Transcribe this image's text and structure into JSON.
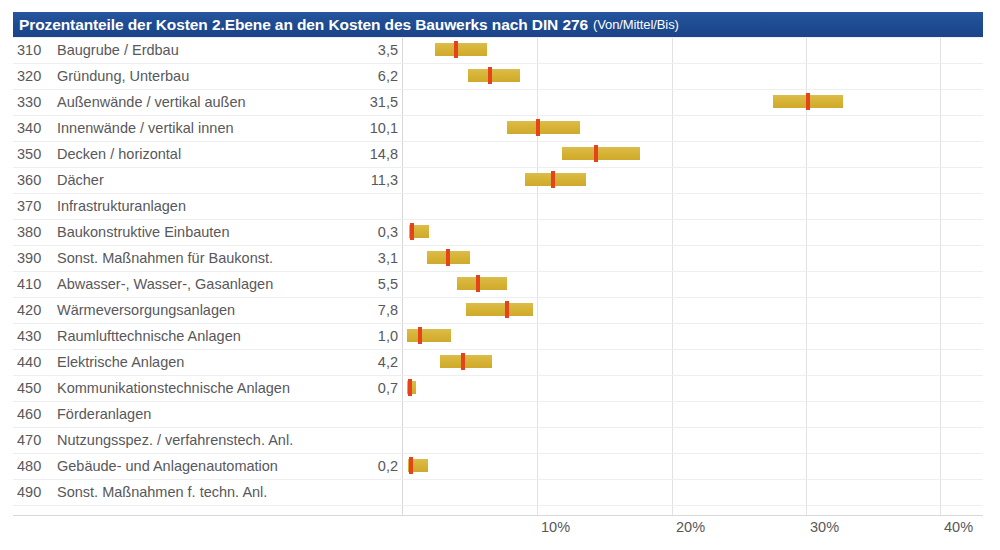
{
  "header": {
    "title": "Prozentanteile der Kosten 2.Ebene an den Kosten des Bauwerks nach DIN 276",
    "subtitle": "(Von/Mittel/Bis)"
  },
  "chart_data": {
    "type": "bar",
    "title": "Prozentanteile der Kosten 2.Ebene an den Kosten des Bauwerks nach DIN 276 (Von/Mittel/Bis)",
    "xlabel": "",
    "ylabel": "",
    "xlim": [
      0,
      43
    ],
    "grid": true,
    "legend": "none",
    "value_series_name": "Mittel",
    "range_series_name": "Von/Bis",
    "xticks": [
      "10%",
      "20%",
      "30%",
      "40%"
    ],
    "xtick_values": [
      10,
      20,
      30,
      40
    ],
    "categories": [
      "310 Baugrube / Erdbau",
      "320 Gründung, Unterbau",
      "330 Außenwände / vertikal außen",
      "340 Innenwände / vertikal innen",
      "350 Decken / horizontal",
      "360 Dächer",
      "370 Infrastrukturanlagen",
      "380 Baukonstruktive Einbauten",
      "390 Sonst. Maßnahmen für Baukonst.",
      "410 Abwasser-, Wasser-, Gasanlagen",
      "420 Wärmeversorgungsanlagen",
      "430 Raumlufttechnische Anlagen",
      "440 Elektrische Anlagen",
      "450 Kommunikationstechnische Anlagen",
      "460 Förderanlagen",
      "470 Nutzungsspez. / verfahrenstech. Anl.",
      "480 Gebäude- und Anlagenautomation",
      "490 Sonst. Maßnahmen f. techn. Anl."
    ],
    "values": [
      3.5,
      6.2,
      31.5,
      10.1,
      14.8,
      11.3,
      null,
      0.3,
      3.1,
      5.5,
      7.8,
      1.0,
      4.2,
      0.7,
      null,
      null,
      0.2,
      null
    ],
    "range_low": [
      2.4,
      4.8,
      27.5,
      7.8,
      11.8,
      9.2,
      null,
      0.5,
      1.9,
      4.1,
      4.8,
      0.4,
      2.8,
      0.4,
      null,
      null,
      0.4,
      null
    ],
    "range_high": [
      6.2,
      8.6,
      32.7,
      13.2,
      17.6,
      13.6,
      null,
      1.9,
      5.0,
      7.8,
      9.7,
      3.6,
      6.7,
      1.0,
      null,
      null,
      1.9,
      null
    ]
  },
  "rows": [
    {
      "code": "310",
      "label": "Baugrube / Erdbau",
      "value": "3,5",
      "bar": {
        "left": 435,
        "width": 52,
        "marker": 454
      }
    },
    {
      "code": "320",
      "label": "Gründung, Unterbau",
      "value": "6,2",
      "bar": {
        "left": 468,
        "width": 52,
        "marker": 488
      }
    },
    {
      "code": "330",
      "label": "Außenwände / vertikal außen",
      "value": "31,5",
      "bar": {
        "left": 773,
        "width": 70,
        "marker": 806
      }
    },
    {
      "code": "340",
      "label": "Innenwände / vertikal innen",
      "value": "10,1",
      "bar": {
        "left": 507,
        "width": 73,
        "marker": 536
      }
    },
    {
      "code": "350",
      "label": "Decken / horizontal",
      "value": "14,8",
      "bar": {
        "left": 562,
        "width": 78,
        "marker": 594
      }
    },
    {
      "code": "360",
      "label": "Dächer",
      "value": "11,3",
      "bar": {
        "left": 525,
        "width": 61,
        "marker": 551
      }
    },
    {
      "code": "370",
      "label": "Infrastrukturanlagen",
      "value": "",
      "bar": null
    },
    {
      "code": "380",
      "label": "Baukonstruktive Einbauten",
      "value": "0,3",
      "bar": {
        "left": 409,
        "width": 20,
        "marker": 410
      }
    },
    {
      "code": "390",
      "label": "Sonst. Maßnahmen für Baukonst.",
      "value": "3,1",
      "bar": {
        "left": 427,
        "width": 43,
        "marker": 446
      }
    },
    {
      "code": "410",
      "label": "Abwasser-, Wasser-, Gasanlagen",
      "value": "5,5",
      "bar": {
        "left": 457,
        "width": 50,
        "marker": 476
      }
    },
    {
      "code": "420",
      "label": "Wärmeversorgungsanlagen",
      "value": "7,8",
      "bar": {
        "left": 466,
        "width": 67,
        "marker": 505
      }
    },
    {
      "code": "430",
      "label": "Raumlufttechnische Anlagen",
      "value": "1,0",
      "bar": {
        "left": 407,
        "width": 44,
        "marker": 418
      }
    },
    {
      "code": "440",
      "label": "Elektrische Anlagen",
      "value": "4,2",
      "bar": {
        "left": 440,
        "width": 52,
        "marker": 461
      }
    },
    {
      "code": "450",
      "label": "Kommunikationstechnische Anlagen",
      "value": "0,7",
      "bar": {
        "left": 407,
        "width": 9,
        "marker": 408
      }
    },
    {
      "code": "460",
      "label": "Förderanlagen",
      "value": "",
      "bar": null
    },
    {
      "code": "470",
      "label": "Nutzungsspez. / verfahrenstech. Anl.",
      "value": "",
      "bar": null
    },
    {
      "code": "480",
      "label": "Gebäude- und Anlagenautomation",
      "value": "0,2",
      "bar": {
        "left": 408,
        "width": 20,
        "marker": 409
      }
    },
    {
      "code": "490",
      "label": "Sonst. Maßnahmen f. techn. Anl.",
      "value": "",
      "bar": null
    }
  ],
  "axis": {
    "zero_x": 402,
    "ticks": [
      {
        "label": "10%",
        "x": 537
      },
      {
        "label": "20%",
        "x": 672
      },
      {
        "label": "30%",
        "x": 806
      },
      {
        "label": "40%",
        "x": 940
      }
    ],
    "gridlines": [
      402,
      537,
      672,
      806,
      940
    ]
  },
  "colors": {
    "header_bg": "#1f4e96",
    "header_text": "#ffffff",
    "bar": "#d8b63e",
    "marker": "#e5431b",
    "text": "#58585b",
    "grid": "#e2e2e6"
  }
}
